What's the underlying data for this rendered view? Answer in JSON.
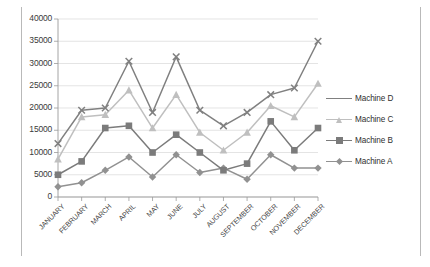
{
  "chart_data": {
    "type": "line",
    "title": "",
    "subtitle": "",
    "xlabel": "",
    "ylabel": "",
    "grid": true,
    "legend_position": "right",
    "categories": [
      "JANUARY",
      "FEBRUARY",
      "MARCH",
      "APRIL",
      "MAY",
      "JUNE",
      "JULY",
      "AUGUST",
      "SEPTEMBER",
      "OCTOBER",
      "NOVEMBER",
      "DECEMBER"
    ],
    "ylim": [
      0,
      40000
    ],
    "yticks": [
      0,
      5000,
      10000,
      15000,
      20000,
      25000,
      30000,
      35000,
      40000
    ],
    "ytick_labels": [
      "0",
      "5000",
      "10000",
      "15000",
      "20000",
      "25000",
      "30000",
      "35000",
      "40000"
    ],
    "series": [
      {
        "name": "Machine D",
        "color": "#808080",
        "marker": "x",
        "values": [
          12000,
          19500,
          20000,
          30500,
          19000,
          31500,
          19500,
          16000,
          19000,
          23000,
          24500,
          35000
        ]
      },
      {
        "name": "Machine C",
        "color": "#bfbfbf",
        "marker": "triangle",
        "values": [
          8500,
          18000,
          18500,
          24000,
          15500,
          23000,
          14500,
          10500,
          14500,
          20500,
          18000,
          25500
        ]
      },
      {
        "name": "Machine B",
        "color": "#7b7b7b",
        "marker": "square",
        "values": [
          5000,
          8000,
          15500,
          16000,
          10000,
          14000,
          10000,
          6000,
          7500,
          17000,
          10500,
          15500
        ]
      },
      {
        "name": "Machine A",
        "color": "#919191",
        "marker": "diamond",
        "values": [
          2300,
          3200,
          6000,
          9000,
          4500,
          9500,
          5500,
          6500,
          4000,
          9500,
          6500,
          6500
        ]
      }
    ]
  },
  "legend": {
    "items": [
      {
        "label": "Machine D"
      },
      {
        "label": "Machine C"
      },
      {
        "label": "Machine B"
      },
      {
        "label": "Machine A"
      }
    ]
  }
}
